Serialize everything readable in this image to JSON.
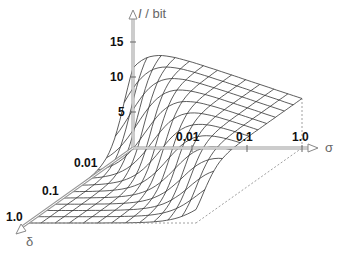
{
  "chart_data": {
    "type": "surface3d",
    "title": "",
    "zlabel": "I / bit",
    "xlabel": "σ",
    "ylabel": "δ",
    "z_ticks": [
      5,
      10,
      15
    ],
    "z_range": [
      0,
      15
    ],
    "x_ticks": [
      "0.01",
      "0.1",
      "1.0"
    ],
    "y_ticks": [
      "0.01",
      "0.1",
      "1.0"
    ],
    "x_scale": "log",
    "y_scale": "log",
    "grid_lines_x": 12,
    "grid_lines_y": 12,
    "corner_values": {
      "sigma_min_delta_min": 15,
      "sigma_max_delta_min": 7,
      "sigma_min_delta_max": 0,
      "sigma_max_delta_max": 0
    }
  },
  "axes": {
    "z_axis_label_italic": "I",
    "z_axis_label_rest": " / bit",
    "sigma_label": "σ",
    "delta_label": "δ",
    "z_tick_labels": [
      "15",
      "10",
      "5"
    ],
    "sigma_tick_labels": [
      "0.01",
      "0.1",
      "1.0"
    ],
    "delta_tick_labels": [
      "0.01",
      "0.1",
      "1.0"
    ]
  },
  "colors": {
    "mesh": "#333333",
    "axis": "#888888",
    "dotted": "#888888",
    "text": "#111111"
  }
}
